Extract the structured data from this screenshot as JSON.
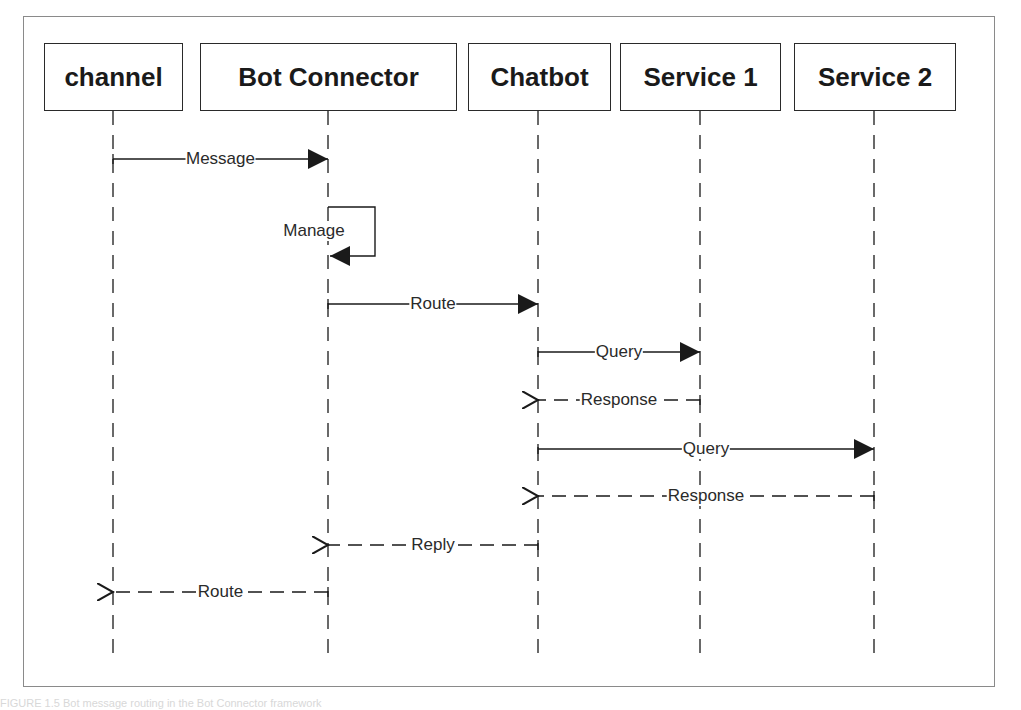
{
  "diagram": {
    "type": "sequence",
    "participants": [
      {
        "name": "channel",
        "x": 113,
        "box_left": 44,
        "box_width": 139
      },
      {
        "name": "Bot Connector",
        "x": 328,
        "box_left": 200,
        "box_width": 257
      },
      {
        "name": "Chatbot",
        "x": 538,
        "box_left": 468,
        "box_width": 143
      },
      {
        "name": "Service 1",
        "x": 700,
        "box_left": 620,
        "box_width": 161
      },
      {
        "name": "Service 2",
        "x": 874,
        "box_left": 794,
        "box_width": 162
      }
    ],
    "messages": [
      {
        "label": "Message",
        "from": "channel",
        "to": "Bot Connector",
        "kind": "sync",
        "y": 159
      },
      {
        "label": "Manage",
        "from": "Bot Connector",
        "to": "Bot Connector",
        "kind": "self",
        "y": 207
      },
      {
        "label": "Route",
        "from": "Bot Connector",
        "to": "Chatbot",
        "kind": "sync",
        "y": 304
      },
      {
        "label": "Query",
        "from": "Chatbot",
        "to": "Service 1",
        "kind": "sync",
        "y": 352
      },
      {
        "label": "Response",
        "from": "Service 1",
        "to": "Chatbot",
        "kind": "return",
        "y": 400
      },
      {
        "label": "Query",
        "from": "Chatbot",
        "to": "Service 2",
        "kind": "sync",
        "y": 449
      },
      {
        "label": "Response",
        "from": "Service 2",
        "to": "Chatbot",
        "kind": "return",
        "y": 496
      },
      {
        "label": "Reply",
        "from": "Chatbot",
        "to": "Bot Connector",
        "kind": "return",
        "y": 545
      },
      {
        "label": "Route",
        "from": "Bot Connector",
        "to": "channel",
        "kind": "return",
        "y": 592
      }
    ]
  },
  "caption": "FIGURE 1.5  Bot message routing in the Bot Connector framework"
}
